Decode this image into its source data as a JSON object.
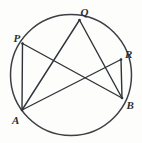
{
  "figure": {
    "kind": "circle-geometry-diagram",
    "background_color": "#fdfdfc",
    "stroke_color": "#2f333a",
    "circle": {
      "center_x": 71,
      "center_y": 75,
      "radius": 60.5
    },
    "points": [
      {
        "id": "P",
        "label": "P",
        "x": 22.5,
        "y": 43.5,
        "label_x": 13.5,
        "label_y": 42.0
      },
      {
        "id": "Q",
        "label": "Q",
        "x": 79.5,
        "y": 20.0,
        "label_x": 80.5,
        "label_y": 16.0
      },
      {
        "id": "R",
        "label": "R",
        "x": 121.0,
        "y": 59.5,
        "label_x": 125.0,
        "label_y": 58.0
      },
      {
        "id": "B",
        "label": "B",
        "x": 122.0,
        "y": 98.0,
        "label_x": 126.5,
        "label_y": 109.0
      },
      {
        "id": "A",
        "label": "A",
        "x": 22.0,
        "y": 110.0,
        "label_x": 12.0,
        "label_y": 124.0
      }
    ],
    "chords": [
      {
        "id": "PA",
        "from": "P",
        "to": "A"
      },
      {
        "id": "PB",
        "from": "P",
        "to": "B"
      },
      {
        "id": "AQ",
        "from": "A",
        "to": "Q"
      },
      {
        "id": "AR",
        "from": "A",
        "to": "R"
      },
      {
        "id": "QB",
        "from": "Q",
        "to": "B"
      },
      {
        "id": "RB",
        "from": "R",
        "to": "B"
      }
    ]
  }
}
